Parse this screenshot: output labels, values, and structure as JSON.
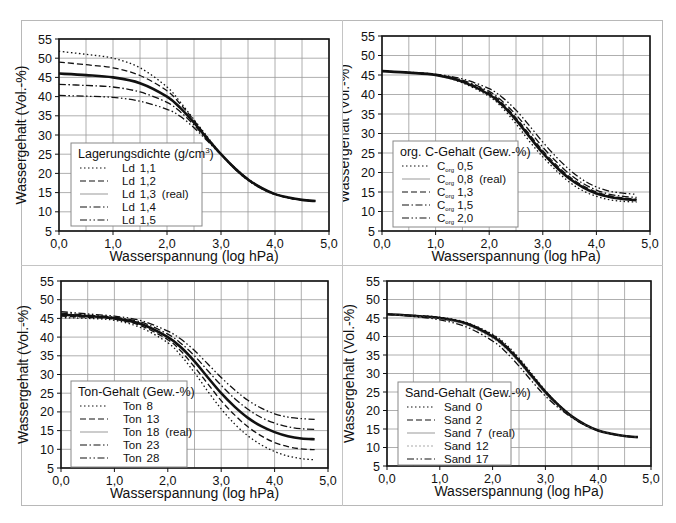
{
  "axes": {
    "xlabel": "Wasserspannung (log hPa)",
    "ylabel": "Wassergehalt (Vol.-%)",
    "xticks": [
      "0,0",
      "1,0",
      "2,0",
      "3,0",
      "4,0",
      "5,0"
    ],
    "yticks": [
      "5",
      "10",
      "15",
      "20",
      "25",
      "30",
      "35",
      "40",
      "45",
      "50",
      "55"
    ],
    "xlim": [
      0,
      5
    ],
    "ylim": [
      5,
      55
    ]
  },
  "chart_data": [
    {
      "type": "line",
      "panel": "top-left",
      "title": "",
      "legend_title": "Lagerungsdichte (g/cm³)",
      "xlabel": "Wasserspannung (log hPa)",
      "ylabel": "Wassergehalt (Vol.-%)",
      "xlim": [
        0,
        5
      ],
      "ylim": [
        5,
        55
      ],
      "grid": true,
      "legend_position": "lower-left",
      "x": [
        0,
        0.5,
        1.0,
        1.5,
        2.0,
        2.25,
        2.5,
        2.75,
        3.0,
        3.25,
        3.5,
        3.75,
        4.0,
        4.25,
        4.5,
        4.75
      ],
      "series": [
        {
          "name": "Ld 1,1",
          "style": "dotted",
          "values": [
            51.8,
            51.0,
            50.0,
            47.5,
            42.5,
            38.5,
            34.0,
            29.5,
            25.0,
            21.2,
            18.2,
            16.0,
            14.5,
            13.6,
            13.1,
            12.8
          ]
        },
        {
          "name": "Ld 1,2",
          "style": "dashed",
          "values": [
            49.0,
            48.3,
            47.5,
            45.5,
            41.5,
            38.0,
            33.8,
            29.3,
            25.0,
            21.3,
            18.3,
            16.1,
            14.6,
            13.6,
            13.1,
            12.8
          ]
        },
        {
          "name": "Ld 1,3 (real)",
          "style": "solid-thick",
          "values": [
            46.0,
            45.6,
            45.0,
            43.5,
            40.0,
            37.0,
            33.2,
            29.0,
            25.0,
            21.4,
            18.4,
            16.2,
            14.6,
            13.7,
            13.1,
            12.8
          ]
        },
        {
          "name": "Ld 1,4",
          "style": "dash-dot",
          "values": [
            43.2,
            42.9,
            42.5,
            41.2,
            38.5,
            36.0,
            32.6,
            28.7,
            25.0,
            21.5,
            18.5,
            16.2,
            14.7,
            13.7,
            13.1,
            12.8
          ]
        },
        {
          "name": "Ld 1,5",
          "style": "dash-dot-dot",
          "values": [
            40.3,
            40.1,
            39.8,
            38.8,
            36.7,
            34.8,
            31.9,
            28.4,
            24.9,
            21.6,
            18.6,
            16.3,
            14.7,
            13.7,
            13.1,
            12.8
          ]
        }
      ]
    },
    {
      "type": "line",
      "panel": "top-right",
      "title": "",
      "legend_title": "org. C-Gehalt (Gew.-%)",
      "xlabel": "Wasserspannung (log hPa)",
      "ylabel": "Wassergehalt (Vol.-%)",
      "xlim": [
        0,
        5
      ],
      "ylim": [
        5,
        55
      ],
      "grid": true,
      "legend_position": "lower-left",
      "x": [
        0,
        0.5,
        1.0,
        1.5,
        2.0,
        2.25,
        2.5,
        2.75,
        3.0,
        3.25,
        3.5,
        3.75,
        4.0,
        4.25,
        4.5,
        4.75
      ],
      "series": [
        {
          "name": "Corg 0,5",
          "style": "dotted",
          "values": [
            46.0,
            45.6,
            45.0,
            43.0,
            39.5,
            36.5,
            32.5,
            28.0,
            24.0,
            20.5,
            17.5,
            15.3,
            13.9,
            13.0,
            12.6,
            12.4
          ]
        },
        {
          "name": "Corg 0,8 (real)",
          "style": "solid-thick",
          "values": [
            46.0,
            45.6,
            45.0,
            43.3,
            40.0,
            37.2,
            33.5,
            29.2,
            25.0,
            21.4,
            18.4,
            16.2,
            14.6,
            13.7,
            13.2,
            12.9
          ]
        },
        {
          "name": "Corg 1,3",
          "style": "dashed",
          "values": [
            46.0,
            45.6,
            45.1,
            43.5,
            40.4,
            37.7,
            34.0,
            29.8,
            25.6,
            22.0,
            18.9,
            16.6,
            15.0,
            14.0,
            13.5,
            13.2
          ]
        },
        {
          "name": "Corg 1,5",
          "style": "dash-dot",
          "values": [
            46.0,
            45.6,
            45.1,
            43.7,
            40.8,
            38.2,
            34.8,
            30.7,
            26.5,
            22.8,
            19.6,
            17.2,
            15.5,
            14.4,
            13.9,
            13.6
          ]
        },
        {
          "name": "Corg 2,0",
          "style": "dash-dot-dot",
          "values": [
            46.0,
            45.7,
            45.2,
            44.0,
            41.5,
            39.2,
            36.0,
            32.0,
            27.8,
            24.0,
            20.7,
            18.1,
            16.3,
            15.2,
            14.7,
            14.4
          ]
        }
      ]
    },
    {
      "type": "line",
      "panel": "bottom-left",
      "title": "",
      "legend_title": "Ton-Gehalt (Gew.-%)",
      "xlabel": "Wasserspannung (log hPa)",
      "ylabel": "Wassergehalt (Vol.-%)",
      "xlim": [
        0,
        5
      ],
      "ylim": [
        5,
        55
      ],
      "grid": true,
      "legend_position": "lower-left",
      "x": [
        0,
        0.5,
        1.0,
        1.5,
        2.0,
        2.25,
        2.5,
        2.75,
        3.0,
        3.25,
        3.5,
        3.75,
        4.0,
        4.25,
        4.5,
        4.75
      ],
      "series": [
        {
          "name": "Ton 8",
          "style": "dotted",
          "values": [
            45.2,
            45.0,
            44.5,
            42.5,
            38.5,
            35.0,
            30.5,
            25.5,
            20.8,
            16.8,
            13.6,
            11.2,
            9.4,
            8.2,
            7.5,
            7.2
          ]
        },
        {
          "name": "Ton 13",
          "style": "dashed",
          "values": [
            45.6,
            45.3,
            44.8,
            43.0,
            39.3,
            36.2,
            32.0,
            27.5,
            23.0,
            19.2,
            16.0,
            13.6,
            11.8,
            10.7,
            10.1,
            9.9
          ]
        },
        {
          "name": "Ton 18 (real)",
          "style": "solid-thick",
          "values": [
            46.0,
            45.6,
            45.0,
            43.5,
            40.0,
            37.2,
            33.5,
            29.2,
            25.0,
            21.4,
            18.4,
            16.2,
            14.6,
            13.5,
            12.9,
            12.7
          ]
        },
        {
          "name": "Ton 23",
          "style": "dash-dot",
          "values": [
            46.4,
            45.9,
            45.3,
            44.0,
            40.8,
            38.3,
            35.0,
            31.0,
            27.1,
            23.6,
            20.7,
            18.5,
            17.0,
            16.0,
            15.5,
            15.3
          ]
        },
        {
          "name": "Ton 28",
          "style": "dash-dot-dot",
          "values": [
            46.8,
            46.2,
            45.6,
            44.4,
            41.6,
            39.4,
            36.4,
            32.8,
            29.2,
            25.9,
            23.1,
            21.0,
            19.5,
            18.6,
            18.2,
            18.0
          ]
        }
      ]
    },
    {
      "type": "line",
      "panel": "bottom-right",
      "title": "",
      "legend_title": "Sand-Gehalt (Gew.-%)",
      "xlabel": "Wasserspannung (log hPa)",
      "ylabel": "Wassergehalt (Vol.-%)",
      "xlim": [
        0,
        5
      ],
      "ylim": [
        5,
        55
      ],
      "grid": true,
      "legend_position": "lower-left",
      "x": [
        0,
        0.5,
        1.0,
        1.5,
        2.0,
        2.25,
        2.5,
        2.75,
        3.0,
        3.25,
        3.5,
        3.75,
        4.0,
        4.25,
        4.5,
        4.75
      ],
      "series": [
        {
          "name": "Sand 0",
          "style": "dotted",
          "values": [
            46.0,
            45.7,
            45.2,
            43.8,
            40.6,
            37.9,
            34.2,
            29.8,
            25.4,
            21.6,
            18.5,
            16.2,
            14.6,
            13.7,
            13.1,
            12.8
          ]
        },
        {
          "name": "Sand 2",
          "style": "dashed",
          "values": [
            46.0,
            45.7,
            45.1,
            43.7,
            40.4,
            37.6,
            33.9,
            29.5,
            25.2,
            21.5,
            18.4,
            16.2,
            14.6,
            13.7,
            13.1,
            12.8
          ]
        },
        {
          "name": "Sand 7 (real)",
          "style": "solid-thick",
          "values": [
            46.0,
            45.6,
            45.0,
            43.5,
            40.0,
            37.2,
            33.5,
            29.2,
            25.0,
            21.4,
            18.4,
            16.2,
            14.6,
            13.7,
            13.1,
            12.8
          ]
        },
        {
          "name": "Sand 12",
          "style": "thin-dotted",
          "values": [
            46.0,
            45.5,
            44.8,
            43.1,
            39.5,
            36.6,
            32.9,
            28.6,
            24.5,
            21.1,
            18.3,
            16.1,
            14.6,
            13.7,
            13.1,
            12.8
          ]
        },
        {
          "name": "Sand 17",
          "style": "dash-dot-dot",
          "values": [
            46.0,
            45.4,
            44.5,
            42.6,
            38.8,
            35.8,
            32.0,
            27.8,
            23.9,
            20.7,
            18.1,
            16.0,
            14.5,
            13.6,
            13.1,
            12.8
          ]
        }
      ]
    }
  ],
  "panels": [
    {
      "legend_title": "Lagerungsdichte (g/cm",
      "legend_title_sup": "3",
      "legend_title_end": ")",
      "items": [
        {
          "prefix": "Ld",
          "sub": "",
          "value": "1,1",
          "note": ""
        },
        {
          "prefix": "Ld",
          "sub": "",
          "value": "1,2",
          "note": ""
        },
        {
          "prefix": "Ld",
          "sub": "",
          "value": "1,3",
          "note": "(real)"
        },
        {
          "prefix": "Ld",
          "sub": "",
          "value": "1,4",
          "note": ""
        },
        {
          "prefix": "Ld",
          "sub": "",
          "value": "1,5",
          "note": ""
        }
      ]
    },
    {
      "legend_title": "org. C-Gehalt (Gew.-%)",
      "legend_title_sup": "",
      "legend_title_end": "",
      "items": [
        {
          "prefix": "C",
          "sub": "org",
          "value": "0,5",
          "note": ""
        },
        {
          "prefix": "C",
          "sub": "org",
          "value": "0,8",
          "note": "(real)"
        },
        {
          "prefix": "C",
          "sub": "org",
          "value": "1,3",
          "note": ""
        },
        {
          "prefix": "C",
          "sub": "org",
          "value": "1,5",
          "note": ""
        },
        {
          "prefix": "C",
          "sub": "org",
          "value": "2,0",
          "note": ""
        }
      ]
    },
    {
      "legend_title": "Ton-Gehalt (Gew.-%)",
      "legend_title_sup": "",
      "legend_title_end": "",
      "items": [
        {
          "prefix": "Ton",
          "sub": "",
          "value": "8",
          "note": ""
        },
        {
          "prefix": "Ton",
          "sub": "",
          "value": "13",
          "note": ""
        },
        {
          "prefix": "Ton",
          "sub": "",
          "value": "18",
          "note": "(real)"
        },
        {
          "prefix": "Ton",
          "sub": "",
          "value": "23",
          "note": ""
        },
        {
          "prefix": "Ton",
          "sub": "",
          "value": "28",
          "note": ""
        }
      ]
    },
    {
      "legend_title": "Sand-Gehalt (Gew.-%)",
      "legend_title_sup": "",
      "legend_title_end": "",
      "items": [
        {
          "prefix": "Sand",
          "sub": "",
          "value": "0",
          "note": ""
        },
        {
          "prefix": "Sand",
          "sub": "",
          "value": "2",
          "note": ""
        },
        {
          "prefix": "Sand",
          "sub": "",
          "value": "7",
          "note": "(real)"
        },
        {
          "prefix": "Sand",
          "sub": "",
          "value": "12",
          "note": ""
        },
        {
          "prefix": "Sand",
          "sub": "",
          "value": "17",
          "note": ""
        }
      ]
    }
  ]
}
